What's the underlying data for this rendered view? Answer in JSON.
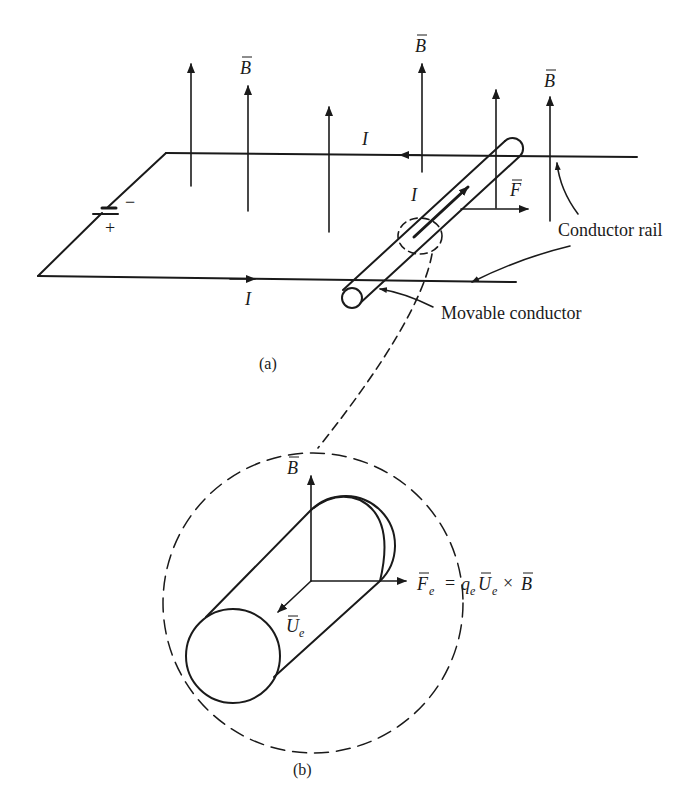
{
  "figure": {
    "part_a": {
      "caption": "(a)",
      "field_label": "B",
      "current_label": "I",
      "force_label": "F",
      "battery": {
        "minus": "−",
        "plus": "+"
      },
      "labels": {
        "conductor_rail": "Conductor rail",
        "movable_conductor": "Movable conductor"
      }
    },
    "part_b": {
      "caption": "(b)",
      "field_label": "B",
      "velocity_label": "U",
      "velocity_sub": "e",
      "force_label": "F",
      "force_sub": "e",
      "equation": {
        "equals": "=",
        "q": "q",
        "q_sub": "e",
        "U": "U",
        "U_sub": "e",
        "cross": "×",
        "B": "B"
      }
    },
    "colors": {
      "ink": "#1a1a1a",
      "background": "#ffffff"
    }
  }
}
